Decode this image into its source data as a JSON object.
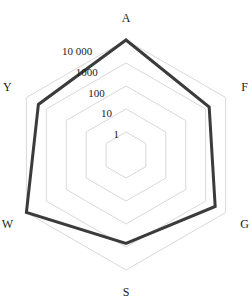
{
  "chart_data": {
    "type": "radar",
    "title": "",
    "subtitle": "",
    "xlabel": "",
    "ylabel": "",
    "scale": "log",
    "grid": true,
    "legend_position": "none",
    "categories": [
      "A",
      "F",
      "G",
      "S",
      "W",
      "Y"
    ],
    "tick_values": [
      1,
      10,
      100,
      1000,
      10000
    ],
    "tick_labels": [
      "1",
      "10",
      "100",
      "1000",
      "10 000"
    ],
    "rlim": [
      1,
      10000
    ],
    "series": [
      {
        "name": "series-1",
        "color": "#3b3b3b",
        "values": [
          10000,
          1500,
          3000,
          700,
          10000,
          2500
        ]
      }
    ],
    "grid_color": "#d9d9d9",
    "axis_label_color": "#1a1a1a"
  },
  "axes": [
    {
      "key": "A",
      "label": "A"
    },
    {
      "key": "F",
      "label": "F"
    },
    {
      "key": "G",
      "label": "G"
    },
    {
      "key": "S",
      "label": "S"
    },
    {
      "key": "W",
      "label": "W"
    },
    {
      "key": "Y",
      "label": "Y"
    }
  ],
  "ticks": [
    {
      "value": 10000,
      "label": "10 000"
    },
    {
      "value": 1000,
      "label": "1000"
    },
    {
      "value": 100,
      "label": "100"
    },
    {
      "value": 10,
      "label": "10"
    },
    {
      "value": 1,
      "label": "1"
    }
  ]
}
